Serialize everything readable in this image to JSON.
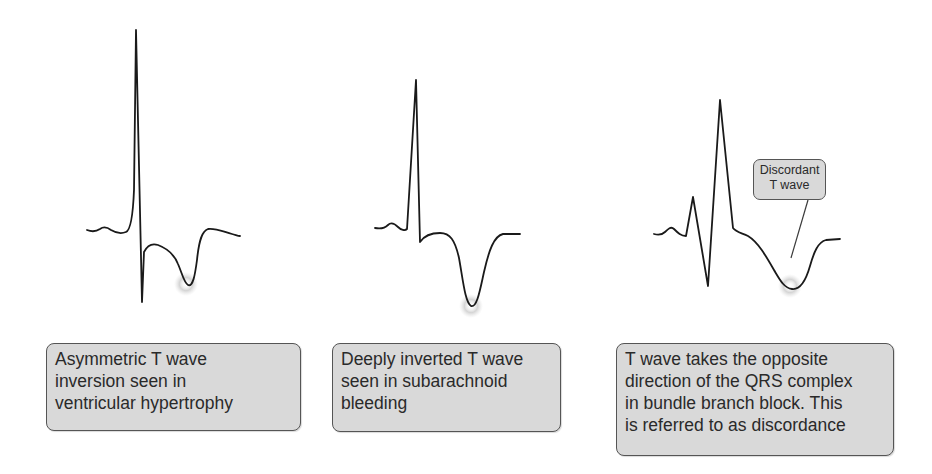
{
  "figure": {
    "panels": [
      {
        "id": "asymmetric",
        "caption_lines": [
          "Asymmetric T wave",
          "inversion seen in",
          "ventricular hypertrophy"
        ]
      },
      {
        "id": "deep",
        "caption_lines": [
          "Deeply inverted T wave",
          "seen in subarachnoid",
          "bleeding"
        ]
      },
      {
        "id": "discordant",
        "caption_lines": [
          "T wave takes the opposite",
          "direction of the QRS complex",
          "in bundle branch block. This",
          "is referred to as discordance"
        ],
        "callout_lines": [
          "Discordant",
          "T wave"
        ]
      }
    ],
    "colors": {
      "trace": "#1a1a1a",
      "caption_fill": "#d9d9d9",
      "caption_border": "#555555",
      "highlight": "#cfcfcf"
    }
  }
}
